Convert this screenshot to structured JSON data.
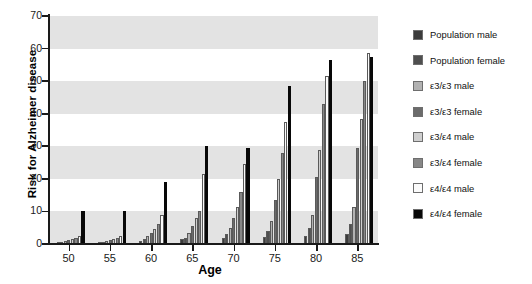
{
  "chart_data": {
    "type": "bar",
    "title": "",
    "xlabel": "Age",
    "ylabel": "Risk for Alzheimer disease",
    "categories": [
      "50",
      "55",
      "60",
      "65",
      "70",
      "75",
      "80",
      "85"
    ],
    "ylim": [
      0,
      70
    ],
    "yticks": [
      0,
      10,
      20,
      30,
      40,
      50,
      60,
      70
    ],
    "grid": "horizontal alternating gray bands",
    "legend_position": "right",
    "series": [
      {
        "name": "Population male",
        "color": "#3b3b3b",
        "values": [
          0.3,
          0.3,
          1.0,
          1.5,
          2.0,
          2.2,
          2.5,
          3.0
        ]
      },
      {
        "name": "Population female",
        "color": "#4f4f4f",
        "values": [
          0.5,
          0.5,
          1.5,
          2.0,
          3.0,
          4.0,
          5.0,
          6.0
        ]
      },
      {
        "name": "ε3/ε3 male",
        "color": "#b2b2b2",
        "values": [
          0.8,
          0.8,
          2.5,
          3.5,
          5.0,
          7.0,
          9.0,
          11.5
        ]
      },
      {
        "name": "ε3/ε3 female",
        "color": "#6b6b6b",
        "values": [
          1.2,
          1.2,
          3.5,
          5.5,
          8.0,
          13.5,
          20.5,
          29.5
        ]
      },
      {
        "name": "ε3/ε4 male",
        "color": "#cfcfcf",
        "values": [
          1.5,
          1.5,
          4.5,
          8.0,
          11.5,
          20.0,
          29.0,
          38.5
        ]
      },
      {
        "name": "ε3/ε4 female",
        "color": "#878787",
        "values": [
          1.8,
          1.8,
          6.0,
          10.0,
          16.0,
          28.0,
          43.0,
          50.0
        ]
      },
      {
        "name": "ε4/ε4 male",
        "color": "#fbfbfb",
        "values": [
          2.5,
          2.5,
          9.0,
          21.5,
          24.5,
          37.5,
          51.5,
          58.5
        ]
      },
      {
        "name": "ε4/ε4 female",
        "color": "#080808",
        "values": [
          10.0,
          10.0,
          19.0,
          30.0,
          29.5,
          48.5,
          56.5,
          57.5
        ]
      }
    ]
  },
  "legend": {
    "items": [
      {
        "label": "Population male",
        "swatch": "#3b3b3b"
      },
      {
        "label": "Population female",
        "swatch": "#4f4f4f"
      },
      {
        "label": "ε3/ε3 male",
        "swatch": "#b2b2b2"
      },
      {
        "label": "ε3/ε3 female",
        "swatch": "#6b6b6b"
      },
      {
        "label": "ε3/ε4 male",
        "swatch": "#cfcfcf"
      },
      {
        "label": "ε3/ε4 female",
        "swatch": "#878787"
      },
      {
        "label": "ε4/ε4 male",
        "swatch": "#fbfbfb"
      },
      {
        "label": "ε4/ε4 female",
        "swatch": "#080808"
      }
    ]
  }
}
